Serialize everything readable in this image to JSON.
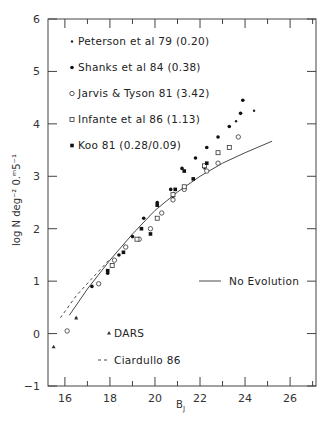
{
  "chart_data": {
    "type": "scatter",
    "title": "",
    "xlabel": "B_J",
    "ylabel": "log N deg^-2 0.m5^-1",
    "xlim": [
      15.25,
      27.15
    ],
    "ylim": [
      -1,
      6
    ],
    "grid": false,
    "x_ticks": [
      16,
      18,
      20,
      22,
      24,
      26
    ],
    "x_minor_ticks": [
      17,
      19,
      21,
      23,
      25,
      27
    ],
    "y_ticks": [
      -1,
      0,
      1,
      2,
      3,
      4,
      5,
      6
    ],
    "legend_position": "inside-upper-left",
    "series": [
      {
        "name": "Peterson et al 79 (0.20)",
        "marker": "small-dot",
        "points": [
          [
            16.5,
            0.3
          ],
          [
            20.8,
            2.6
          ],
          [
            22.2,
            3.15
          ],
          [
            23.6,
            4.05
          ],
          [
            24.4,
            4.25
          ]
        ]
      },
      {
        "name": "Shanks et al 84 (0.38)",
        "marker": "filled-circle",
        "points": [
          [
            17.2,
            0.9
          ],
          [
            17.9,
            1.15
          ],
          [
            18.4,
            1.5
          ],
          [
            19.0,
            1.85
          ],
          [
            19.5,
            2.2
          ],
          [
            20.1,
            2.5
          ],
          [
            20.7,
            2.75
          ],
          [
            21.2,
            3.15
          ],
          [
            21.8,
            3.35
          ],
          [
            22.3,
            3.55
          ],
          [
            22.8,
            3.75
          ],
          [
            23.3,
            3.95
          ],
          [
            23.8,
            4.2
          ],
          [
            23.9,
            4.45
          ]
        ]
      },
      {
        "name": "Jarvis & Tyson 81 (3.42)",
        "marker": "open-circle",
        "points": [
          [
            16.1,
            0.05
          ],
          [
            17.5,
            0.95
          ],
          [
            18.2,
            1.4
          ],
          [
            18.7,
            1.65
          ],
          [
            19.3,
            1.8
          ],
          [
            19.8,
            2.0
          ],
          [
            20.3,
            2.3
          ],
          [
            20.8,
            2.55
          ],
          [
            21.3,
            2.75
          ],
          [
            22.3,
            3.1
          ],
          [
            22.8,
            3.25
          ],
          [
            23.7,
            3.75
          ]
        ]
      },
      {
        "name": "Infante et al 86 (1.13)",
        "marker": "open-square",
        "points": [
          [
            18.1,
            1.3
          ],
          [
            19.2,
            1.8
          ],
          [
            20.1,
            2.2
          ],
          [
            20.8,
            2.65
          ],
          [
            21.3,
            2.8
          ],
          [
            22.2,
            3.2
          ],
          [
            22.8,
            3.45
          ],
          [
            23.3,
            3.55
          ]
        ]
      },
      {
        "name": "Koo 81 (0.28/0.09)",
        "marker": "filled-square",
        "points": [
          [
            17.9,
            1.2
          ],
          [
            18.6,
            1.55
          ],
          [
            19.4,
            2.0
          ],
          [
            19.8,
            1.9
          ],
          [
            20.1,
            2.45
          ],
          [
            20.9,
            2.75
          ],
          [
            21.3,
            3.1
          ],
          [
            21.7,
            2.95
          ],
          [
            22.3,
            3.25
          ]
        ]
      },
      {
        "name": "DARS",
        "marker": "triangle",
        "points": [
          [
            15.5,
            -0.25
          ],
          [
            16.5,
            0.3
          ]
        ]
      }
    ],
    "lines": [
      {
        "name": "No Evolution",
        "style": "solid",
        "points": [
          [
            16.2,
            0.35
          ],
          [
            17,
            0.85
          ],
          [
            18,
            1.4
          ],
          [
            19,
            1.9
          ],
          [
            20,
            2.35
          ],
          [
            21,
            2.7
          ],
          [
            22,
            3.0
          ],
          [
            23,
            3.25
          ],
          [
            24,
            3.45
          ],
          [
            25.2,
            3.67
          ]
        ]
      },
      {
        "name": "Ciardullo 86",
        "style": "dashed",
        "points": [
          [
            15.8,
            0.3
          ],
          [
            16.5,
            0.72
          ],
          [
            17.2,
            1.05
          ],
          [
            18,
            1.42
          ]
        ]
      }
    ]
  },
  "legend": {
    "items": [
      {
        "label": "Peterson et al 79 (0.20)",
        "marker": "small-dot"
      },
      {
        "label": "Shanks et al 84 (0.38)",
        "marker": "filled-circle"
      },
      {
        "label": "Jarvis & Tyson 81 (3.42)",
        "marker": "open-circle"
      },
      {
        "label": "Infante et al 86 (1.13)",
        "marker": "open-square"
      },
      {
        "label": "Koo 81 (0.28/0.09)",
        "marker": "filled-square"
      }
    ],
    "no_evolution_label": "No Evolution",
    "dars_label": "DARS",
    "ciardullo_label": "Ciardullo 86"
  },
  "axes": {
    "x_label_main": "B",
    "x_label_sub": "J",
    "y_label": "log N deg⁻² 0.ᵐ5⁻¹"
  }
}
